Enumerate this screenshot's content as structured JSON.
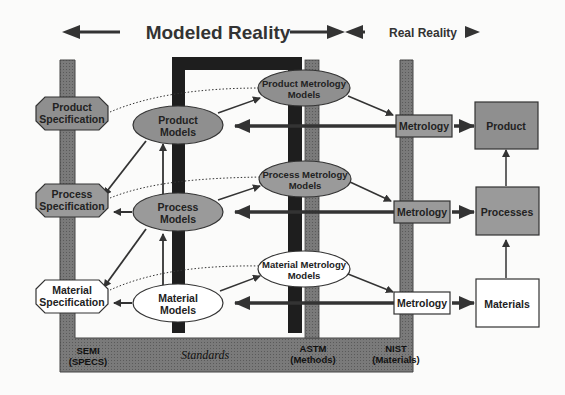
{
  "header": {
    "modeled_reality": "Modeled Reality",
    "real_reality": "Real Reality"
  },
  "specifications": [
    {
      "id": "product",
      "label_line1": "Product",
      "label_line2": "Specification",
      "fill": "#8f8f8f"
    },
    {
      "id": "process",
      "label_line1": "Process",
      "label_line2": "Specification",
      "fill": "#9a9a9a"
    },
    {
      "id": "material",
      "label_line1": "Material",
      "label_line2": "Specification",
      "fill": "#ffffff"
    }
  ],
  "models": [
    {
      "id": "product",
      "label_line1": "Product",
      "label_line2": "Models",
      "fill": "#8f8f8f"
    },
    {
      "id": "process",
      "label_line1": "Process",
      "label_line2": "Models",
      "fill": "#9a9a9a"
    },
    {
      "id": "material",
      "label_line1": "Material",
      "label_line2": "Models",
      "fill": "#ffffff"
    }
  ],
  "metrology_models": [
    {
      "id": "product",
      "label_line1": "Product Metrology",
      "label_line2": "Models",
      "fill": "#8f8f8f"
    },
    {
      "id": "process",
      "label_line1": "Process Metrology",
      "label_line2": "Models",
      "fill": "#9a9a9a"
    },
    {
      "id": "material",
      "label_line1": "Material Metrology",
      "label_line2": "Models",
      "fill": "#ffffff"
    }
  ],
  "metrology_boxes": [
    {
      "id": "product",
      "label": "Metrology",
      "fill": "#9a9a9a"
    },
    {
      "id": "process",
      "label": "Metrology",
      "fill": "#9a9a9a"
    },
    {
      "id": "material",
      "label": "Metrology",
      "fill": "#ffffff"
    }
  ],
  "reality_boxes": [
    {
      "id": "product",
      "label": "Product",
      "fill": "#8f8f8f"
    },
    {
      "id": "processes",
      "label": "Processes",
      "fill": "#9a9a9a"
    },
    {
      "id": "materials",
      "label": "Materials",
      "fill": "#ffffff"
    }
  ],
  "base": {
    "semi_line1": "SEMI",
    "semi_line2": "(SPECS)",
    "standards": "Standards",
    "astm_line1": "ASTM",
    "astm_line2": "(Methods)",
    "nist_line1": "NIST",
    "nist_line2": "(Materials)"
  },
  "colors": {
    "bar_gray": "#6e6e6e",
    "bar_dark": "#1e1e1e",
    "arrow": "#333333",
    "base_fill": "#7a7a7a"
  }
}
